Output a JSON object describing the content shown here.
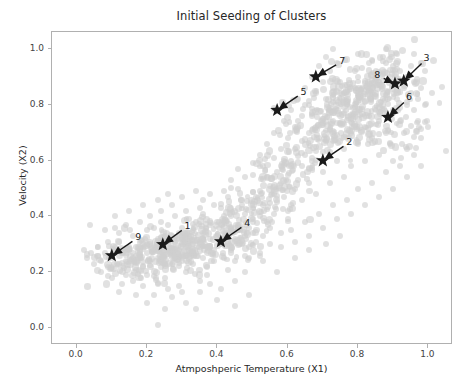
{
  "chart_data": {
    "type": "scatter",
    "title": "Initial Seeding of Clusters",
    "xlabel": "Atmposhperic Temperature (X1)",
    "ylabel": "Velocity (X2)",
    "xlim": [
      -0.07,
      1.07
    ],
    "ylim": [
      -0.06,
      1.06
    ],
    "xticks": [
      0.0,
      0.2,
      0.4,
      0.6,
      0.8,
      1.0
    ],
    "xticklabels": [
      "0.0",
      "0.2",
      "0.4",
      "0.6",
      "0.8",
      "1.0"
    ],
    "yticks": [
      0.0,
      0.2,
      0.4,
      0.6,
      0.8,
      1.0
    ],
    "yticklabels": [
      "0.0",
      "0.2",
      "0.4",
      "0.6",
      "0.8",
      "1.0"
    ],
    "grid": false,
    "legend": null,
    "series": [
      {
        "name": "data points",
        "marker": "circle",
        "color": "#cfcfcf",
        "alpha": 0.62,
        "size": 6,
        "note": "dense elongated cloud running lower-left to upper-right; lower-left lobe centred near (0.25,0.28), upper-right lobe centred near (0.78,0.80)"
      },
      {
        "name": "initial centroids",
        "marker": "star",
        "color": "#1a1a1a",
        "size": 14,
        "points": [
          {
            "label": "9",
            "x": 0.1,
            "y": 0.26
          },
          {
            "label": "1",
            "x": 0.245,
            "y": 0.3
          },
          {
            "label": "4",
            "x": 0.41,
            "y": 0.31
          },
          {
            "label": "2",
            "x": 0.7,
            "y": 0.6
          },
          {
            "label": "5",
            "x": 0.57,
            "y": 0.78
          },
          {
            "label": "7",
            "x": 0.68,
            "y": 0.9
          },
          {
            "label": "6",
            "x": 0.885,
            "y": 0.755
          },
          {
            "label": "8",
            "x": 0.905,
            "y": 0.875
          },
          {
            "label": "3",
            "x": 0.93,
            "y": 0.885
          }
        ]
      }
    ],
    "annotations": [
      {
        "text": "9",
        "point_x": 0.1,
        "point_y": 0.26,
        "text_x": 0.175,
        "text_y": 0.325
      },
      {
        "text": "1",
        "point_x": 0.245,
        "point_y": 0.3,
        "text_x": 0.315,
        "text_y": 0.365
      },
      {
        "text": "4",
        "point_x": 0.41,
        "point_y": 0.31,
        "text_x": 0.485,
        "text_y": 0.375
      },
      {
        "text": "2",
        "point_x": 0.7,
        "point_y": 0.6,
        "text_x": 0.775,
        "text_y": 0.665
      },
      {
        "text": "5",
        "point_x": 0.57,
        "point_y": 0.78,
        "text_x": 0.645,
        "text_y": 0.845
      },
      {
        "text": "7",
        "point_x": 0.68,
        "point_y": 0.9,
        "text_x": 0.755,
        "text_y": 0.955
      },
      {
        "text": "6",
        "point_x": 0.885,
        "point_y": 0.755,
        "text_x": 0.945,
        "text_y": 0.825
      },
      {
        "text": "8",
        "point_x": 0.905,
        "point_y": 0.875,
        "text_x": 0.855,
        "text_y": 0.905
      },
      {
        "text": "3",
        "point_x": 0.93,
        "point_y": 0.885,
        "text_x": 0.995,
        "text_y": 0.965
      }
    ],
    "scatter_points": [
      [
        0.23,
        0.01
      ],
      [
        0.09,
        0.22
      ],
      [
        0.1,
        0.25
      ],
      [
        0.07,
        0.24
      ],
      [
        0.12,
        0.23
      ],
      [
        0.13,
        0.27
      ],
      [
        0.11,
        0.29
      ],
      [
        0.08,
        0.27
      ],
      [
        0.14,
        0.24
      ],
      [
        0.06,
        0.26
      ],
      [
        0.15,
        0.28
      ],
      [
        0.12,
        0.31
      ],
      [
        0.16,
        0.25
      ],
      [
        0.17,
        0.29
      ],
      [
        0.18,
        0.26
      ],
      [
        0.19,
        0.3
      ],
      [
        0.2,
        0.27
      ],
      [
        0.21,
        0.31
      ],
      [
        0.22,
        0.28
      ],
      [
        0.23,
        0.32
      ],
      [
        0.24,
        0.29
      ],
      [
        0.25,
        0.33
      ],
      [
        0.26,
        0.3
      ],
      [
        0.27,
        0.27
      ],
      [
        0.28,
        0.31
      ],
      [
        0.29,
        0.28
      ],
      [
        0.3,
        0.32
      ],
      [
        0.31,
        0.29
      ],
      [
        0.32,
        0.33
      ],
      [
        0.33,
        0.3
      ],
      [
        0.34,
        0.27
      ],
      [
        0.35,
        0.31
      ],
      [
        0.36,
        0.34
      ],
      [
        0.37,
        0.29
      ],
      [
        0.38,
        0.32
      ],
      [
        0.39,
        0.28
      ],
      [
        0.4,
        0.33
      ],
      [
        0.41,
        0.3
      ],
      [
        0.42,
        0.34
      ],
      [
        0.43,
        0.31
      ],
      [
        0.44,
        0.28
      ],
      [
        0.45,
        0.32
      ],
      [
        0.46,
        0.35
      ],
      [
        0.47,
        0.3
      ],
      [
        0.48,
        0.33
      ],
      [
        0.49,
        0.29
      ],
      [
        0.5,
        0.34
      ],
      [
        0.51,
        0.31
      ],
      [
        0.19,
        0.22
      ],
      [
        0.21,
        0.24
      ],
      [
        0.24,
        0.22
      ],
      [
        0.27,
        0.23
      ],
      [
        0.3,
        0.24
      ],
      [
        0.33,
        0.23
      ],
      [
        0.36,
        0.25
      ],
      [
        0.39,
        0.24
      ],
      [
        0.42,
        0.25
      ],
      [
        0.45,
        0.24
      ],
      [
        0.48,
        0.26
      ],
      [
        0.22,
        0.36
      ],
      [
        0.26,
        0.37
      ],
      [
        0.3,
        0.36
      ],
      [
        0.34,
        0.38
      ],
      [
        0.38,
        0.37
      ],
      [
        0.42,
        0.38
      ],
      [
        0.46,
        0.37
      ],
      [
        0.5,
        0.38
      ],
      [
        0.53,
        0.33
      ],
      [
        0.55,
        0.36
      ],
      [
        0.52,
        0.4
      ],
      [
        0.56,
        0.41
      ],
      [
        0.2,
        0.19
      ],
      [
        0.25,
        0.18
      ],
      [
        0.31,
        0.2
      ],
      [
        0.37,
        0.19
      ],
      [
        0.43,
        0.21
      ],
      [
        0.29,
        0.15
      ],
      [
        0.35,
        0.17
      ],
      [
        0.17,
        0.21
      ],
      [
        0.14,
        0.19
      ],
      [
        0.48,
        0.2
      ],
      [
        0.52,
        0.27
      ],
      [
        0.55,
        0.3
      ],
      [
        0.58,
        0.34
      ],
      [
        0.6,
        0.39
      ],
      [
        0.57,
        0.45
      ],
      [
        0.53,
        0.44
      ],
      [
        0.5,
        0.43
      ],
      [
        0.56,
        0.48
      ],
      [
        0.59,
        0.47
      ],
      [
        0.61,
        0.44
      ],
      [
        0.62,
        0.5
      ],
      [
        0.58,
        0.52
      ],
      [
        0.55,
        0.51
      ],
      [
        0.6,
        0.55
      ],
      [
        0.63,
        0.53
      ],
      [
        0.64,
        0.58
      ],
      [
        0.61,
        0.6
      ],
      [
        0.58,
        0.58
      ],
      [
        0.65,
        0.62
      ],
      [
        0.62,
        0.64
      ],
      [
        0.66,
        0.57
      ],
      [
        0.67,
        0.61
      ],
      [
        0.68,
        0.65
      ],
      [
        0.64,
        0.67
      ],
      [
        0.69,
        0.68
      ],
      [
        0.66,
        0.7
      ],
      [
        0.7,
        0.63
      ],
      [
        0.71,
        0.67
      ],
      [
        0.72,
        0.71
      ],
      [
        0.68,
        0.72
      ],
      [
        0.73,
        0.74
      ],
      [
        0.7,
        0.75
      ],
      [
        0.74,
        0.69
      ],
      [
        0.75,
        0.73
      ],
      [
        0.76,
        0.77
      ],
      [
        0.72,
        0.78
      ],
      [
        0.77,
        0.8
      ],
      [
        0.73,
        0.81
      ],
      [
        0.78,
        0.75
      ],
      [
        0.79,
        0.79
      ],
      [
        0.8,
        0.83
      ],
      [
        0.76,
        0.84
      ],
      [
        0.81,
        0.86
      ],
      [
        0.77,
        0.87
      ],
      [
        0.82,
        0.81
      ],
      [
        0.83,
        0.85
      ],
      [
        0.84,
        0.89
      ],
      [
        0.8,
        0.9
      ],
      [
        0.85,
        0.92
      ],
      [
        0.81,
        0.93
      ],
      [
        0.86,
        0.87
      ],
      [
        0.87,
        0.91
      ],
      [
        0.88,
        0.95
      ],
      [
        0.84,
        0.96
      ],
      [
        0.89,
        0.9
      ],
      [
        0.9,
        0.94
      ],
      [
        0.91,
        0.88
      ],
      [
        0.92,
        0.92
      ],
      [
        0.93,
        0.86
      ],
      [
        0.94,
        0.9
      ],
      [
        0.95,
        0.84
      ],
      [
        0.96,
        0.88
      ],
      [
        0.97,
        0.82
      ],
      [
        0.62,
        0.72
      ],
      [
        0.64,
        0.76
      ],
      [
        0.66,
        0.8
      ],
      [
        0.68,
        0.84
      ],
      [
        0.7,
        0.88
      ],
      [
        0.72,
        0.92
      ],
      [
        0.74,
        0.95
      ],
      [
        0.6,
        0.68
      ],
      [
        0.58,
        0.64
      ],
      [
        0.56,
        0.7
      ],
      [
        0.59,
        0.74
      ],
      [
        0.61,
        0.78
      ],
      [
        0.63,
        0.82
      ],
      [
        0.65,
        0.86
      ],
      [
        0.67,
        0.9
      ],
      [
        0.69,
        0.94
      ],
      [
        0.71,
        0.97
      ],
      [
        0.75,
        0.88
      ],
      [
        0.79,
        0.92
      ],
      [
        0.83,
        0.95
      ],
      [
        0.87,
        0.97
      ],
      [
        0.78,
        0.7
      ],
      [
        0.82,
        0.72
      ],
      [
        0.86,
        0.74
      ],
      [
        0.9,
        0.78
      ],
      [
        0.94,
        0.8
      ],
      [
        0.88,
        0.7
      ],
      [
        0.92,
        0.74
      ],
      [
        0.96,
        0.78
      ],
      [
        0.84,
        0.68
      ],
      [
        0.8,
        0.66
      ],
      [
        0.76,
        0.64
      ],
      [
        0.89,
        0.66
      ],
      [
        0.93,
        0.7
      ],
      [
        0.97,
        0.74
      ],
      [
        0.99,
        0.8
      ],
      [
        0.98,
        0.86
      ],
      [
        0.95,
        0.94
      ],
      [
        0.91,
        0.98
      ],
      [
        0.74,
        0.6
      ],
      [
        0.78,
        0.58
      ],
      [
        0.7,
        0.56
      ],
      [
        0.66,
        0.52
      ],
      [
        0.72,
        0.52
      ],
      [
        0.76,
        0.54
      ],
      [
        0.68,
        0.48
      ],
      [
        0.64,
        0.46
      ],
      [
        0.6,
        0.42
      ],
      [
        0.54,
        0.38
      ],
      [
        0.49,
        0.36
      ],
      [
        0.44,
        0.4
      ],
      [
        0.4,
        0.38
      ],
      [
        0.36,
        0.41
      ],
      [
        0.32,
        0.39
      ],
      [
        0.28,
        0.4
      ],
      [
        0.24,
        0.38
      ],
      [
        0.2,
        0.35
      ],
      [
        0.16,
        0.33
      ],
      [
        0.12,
        0.34
      ],
      [
        0.09,
        0.31
      ],
      [
        0.06,
        0.29
      ],
      [
        0.05,
        0.23
      ],
      [
        0.04,
        0.27
      ],
      [
        0.07,
        0.2
      ],
      [
        0.1,
        0.18
      ],
      [
        0.13,
        0.16
      ],
      [
        0.16,
        0.17
      ],
      [
        0.19,
        0.15
      ],
      [
        0.23,
        0.16
      ],
      [
        0.26,
        0.14
      ],
      [
        0.3,
        0.13
      ],
      [
        0.22,
        0.12
      ],
      [
        0.27,
        0.11
      ],
      [
        0.31,
        0.09
      ],
      [
        0.35,
        0.13
      ],
      [
        0.38,
        0.16
      ],
      [
        0.41,
        0.14
      ],
      [
        0.45,
        0.17
      ],
      [
        0.33,
        0.35
      ],
      [
        0.29,
        0.34
      ],
      [
        0.18,
        0.38
      ],
      [
        0.14,
        0.37
      ],
      [
        0.11,
        0.36
      ],
      [
        0.47,
        0.44
      ],
      [
        0.51,
        0.47
      ],
      [
        0.54,
        0.54
      ],
      [
        0.57,
        0.56
      ],
      [
        0.59,
        0.6
      ],
      [
        0.53,
        0.58
      ],
      [
        0.5,
        0.55
      ],
      [
        0.46,
        0.5
      ],
      [
        0.43,
        0.47
      ],
      [
        0.39,
        0.44
      ],
      [
        0.35,
        0.43
      ],
      [
        0.31,
        0.42
      ],
      [
        0.27,
        0.44
      ],
      [
        0.24,
        0.42
      ],
      [
        0.21,
        0.4
      ],
      [
        0.85,
        0.78
      ],
      [
        0.87,
        0.82
      ],
      [
        0.83,
        0.76
      ],
      [
        0.79,
        0.86
      ],
      [
        0.75,
        0.84
      ],
      [
        0.71,
        0.82
      ],
      [
        0.67,
        0.76
      ],
      [
        0.63,
        0.74
      ],
      [
        0.98,
        0.68
      ],
      [
        0.94,
        0.64
      ],
      [
        0.9,
        0.6
      ],
      [
        0.86,
        0.62
      ],
      [
        0.82,
        0.6
      ],
      [
        0.88,
        0.56
      ],
      [
        0.92,
        0.58
      ],
      [
        0.96,
        0.62
      ],
      [
        0.84,
        0.52
      ],
      [
        0.8,
        0.5
      ],
      [
        0.77,
        0.46
      ],
      [
        0.73,
        0.44
      ],
      [
        0.69,
        0.41
      ],
      [
        0.65,
        0.38
      ],
      [
        0.61,
        0.35
      ],
      [
        0.58,
        0.29
      ],
      [
        0.62,
        0.31
      ],
      [
        0.66,
        0.33
      ],
      [
        0.7,
        0.36
      ],
      [
        0.74,
        0.39
      ],
      [
        0.78,
        0.41
      ],
      [
        0.82,
        0.44
      ],
      [
        0.86,
        0.47
      ],
      [
        0.9,
        0.5
      ],
      [
        0.94,
        0.54
      ],
      [
        0.98,
        0.58
      ],
      [
        1.0,
        0.72
      ],
      [
        1.01,
        0.84
      ],
      [
        0.99,
        0.92
      ],
      [
        0.96,
        0.98
      ],
      [
        0.88,
        1.0
      ],
      [
        0.8,
        0.98
      ],
      [
        0.73,
        1.0
      ],
      [
        0.03,
        0.25
      ],
      [
        0.02,
        0.28
      ],
      [
        0.45,
        0.08
      ],
      [
        0.53,
        0.24
      ],
      [
        0.49,
        0.12
      ],
      [
        0.57,
        0.2
      ],
      [
        0.62,
        0.25
      ],
      [
        0.66,
        0.28
      ],
      [
        0.71,
        0.3
      ],
      [
        0.75,
        0.33
      ],
      [
        0.34,
        0.07
      ],
      [
        0.4,
        0.1
      ],
      [
        0.37,
        0.22
      ],
      [
        0.44,
        0.35
      ],
      [
        0.48,
        0.41
      ],
      [
        0.52,
        0.49
      ],
      [
        0.56,
        0.61
      ],
      [
        0.54,
        0.66
      ],
      [
        0.52,
        0.62
      ],
      [
        0.5,
        0.59
      ],
      [
        0.48,
        0.54
      ],
      [
        0.46,
        0.57
      ],
      [
        0.44,
        0.53
      ],
      [
        0.42,
        0.49
      ],
      [
        0.38,
        0.48
      ],
      [
        0.36,
        0.46
      ],
      [
        0.34,
        0.49
      ],
      [
        0.3,
        0.47
      ],
      [
        0.26,
        0.48
      ],
      [
        0.23,
        0.46
      ],
      [
        0.19,
        0.44
      ],
      [
        0.15,
        0.42
      ],
      [
        0.11,
        0.4
      ],
      [
        0.08,
        0.35
      ],
      [
        0.17,
        0.12
      ],
      [
        0.12,
        0.13
      ],
      [
        0.2,
        0.09
      ],
      [
        0.25,
        0.07
      ]
    ]
  }
}
